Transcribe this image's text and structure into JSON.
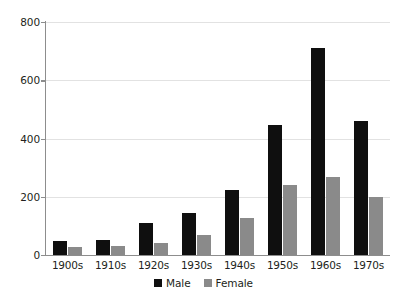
{
  "chart_data": {
    "type": "bar",
    "title": "",
    "subtitle": "",
    "xlabel": "",
    "ylabel": "",
    "categories": [
      "1900s",
      "1910s",
      "1920s",
      "1930s",
      "1940s",
      "1950s",
      "1960s",
      "1970s"
    ],
    "series": [
      {
        "name": "Male",
        "color": "#0f0f0f",
        "values": [
          48,
          50,
          110,
          143,
          223,
          445,
          710,
          460
        ]
      },
      {
        "name": "Female",
        "color": "#8a8a8a",
        "values": [
          28,
          30,
          42,
          70,
          127,
          240,
          268,
          200
        ]
      }
    ],
    "ylim": [
      0,
      800
    ],
    "yticks": [
      0,
      200,
      400,
      600,
      800
    ],
    "ytick_labels": [
      "0",
      "200",
      "400",
      "600",
      "800"
    ],
    "grid": true,
    "grid_axis": "y",
    "legend_position": "bottom-center",
    "legend_entries": [
      "Male",
      "Female"
    ],
    "background": "#ffffff",
    "axis_color": "#8d8d8d",
    "grid_color": "#e2e2e2"
  }
}
